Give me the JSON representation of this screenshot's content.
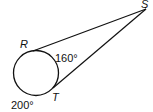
{
  "diagram": {
    "type": "circle-with-two-tangents",
    "points": {
      "R": "R",
      "S": "S",
      "T": "T"
    },
    "arcs": {
      "minor_arc_RT": "160°",
      "major_arc_RT": "200°"
    },
    "colors": {
      "stroke": "#111111",
      "background": "#ffffff"
    }
  }
}
